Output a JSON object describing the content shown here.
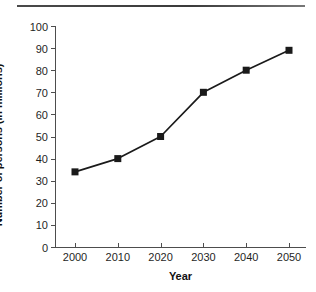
{
  "figure": {
    "top_rule": "horizontal-rule",
    "background_color": "#ffffff",
    "line_color": "#1a1a1a",
    "axis_color": "#4d4d4d"
  },
  "chart_data": {
    "type": "line",
    "title": "",
    "xlabel": "Year",
    "ylabel": "Number of persons (in millions)",
    "categories": [
      "2000",
      "2010",
      "2020",
      "2030",
      "2040",
      "2050"
    ],
    "x": [
      2000,
      2010,
      2020,
      2030,
      2040,
      2050
    ],
    "values": [
      34,
      40,
      50,
      70,
      80,
      89
    ],
    "series": [
      {
        "name": "Number of persons",
        "values": [
          34,
          40,
          50,
          70,
          80,
          89
        ],
        "marker": "square",
        "marker_color": "#1a1a1a",
        "line_color": "#1a1a1a"
      }
    ],
    "xlim": [
      1995,
      2055
    ],
    "ylim": [
      0,
      100
    ],
    "ytick_labels": [
      "0",
      "10",
      "20",
      "30",
      "40",
      "50",
      "60",
      "70",
      "80",
      "90",
      "100"
    ],
    "yticks": [
      0,
      10,
      20,
      30,
      40,
      50,
      60,
      70,
      80,
      90,
      100
    ],
    "xtick_labels": [
      "2000",
      "2010",
      "2020",
      "2030",
      "2040",
      "2050"
    ],
    "grid": false,
    "legend": false,
    "legend_position": "none"
  }
}
